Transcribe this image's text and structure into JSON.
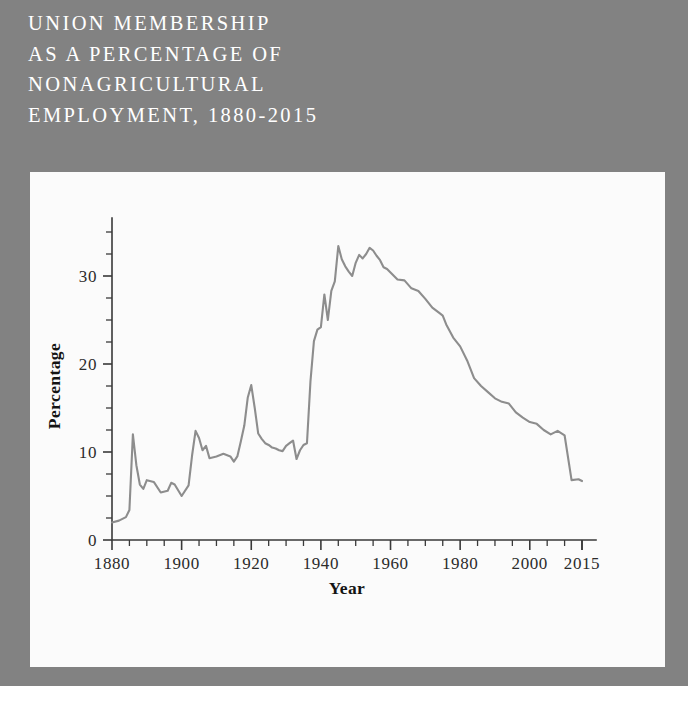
{
  "figure": {
    "title_lines": "UNION MEMBERSHIP\nAS A PERCENTAGE OF\nNONAGRICULTURAL\nEMPLOYMENT, 1880-2015",
    "backdrop_color": "#828282",
    "panel_color": "#fbfbfb",
    "title_color": "#ffffff"
  },
  "chart_data": {
    "type": "line",
    "title": "UNION MEMBERSHIP AS A PERCENTAGE OF NONAGRICULTURAL EMPLOYMENT, 1880-2015",
    "xlabel": "Year",
    "ylabel": "Percentage",
    "xlim": [
      1880,
      2015
    ],
    "ylim": [
      0,
      35
    ],
    "grid": false,
    "legend": "none",
    "line_color": "#8d8d8d",
    "x_major_ticks": [
      1880,
      1900,
      1920,
      1940,
      1960,
      1980,
      2000,
      2015
    ],
    "x_major_tick_labels": [
      "1880",
      "1900",
      "1920",
      "1940",
      "1960",
      "1980",
      "2000",
      "2015"
    ],
    "x_minor_tick_interval": 5,
    "y_major_ticks": [
      0,
      10,
      20,
      30
    ],
    "y_major_tick_labels": [
      "0",
      "10",
      "20",
      "30"
    ],
    "y_minor_tick_interval": 2.5,
    "series": [
      {
        "name": "Union membership",
        "x": [
          1880,
          1882,
          1884,
          1885,
          1886,
          1887,
          1888,
          1889,
          1890,
          1892,
          1894,
          1896,
          1897,
          1898,
          1900,
          1902,
          1903,
          1904,
          1905,
          1906,
          1907,
          1908,
          1910,
          1912,
          1914,
          1915,
          1916,
          1917,
          1918,
          1919,
          1920,
          1921,
          1922,
          1923,
          1924,
          1925,
          1926,
          1927,
          1928,
          1929,
          1930,
          1931,
          1932,
          1933,
          1934,
          1935,
          1936,
          1937,
          1938,
          1939,
          1940,
          1941,
          1942,
          1943,
          1944,
          1945,
          1946,
          1947,
          1948,
          1949,
          1950,
          1951,
          1952,
          1953,
          1954,
          1955,
          1956,
          1957,
          1958,
          1959,
          1960,
          1962,
          1964,
          1966,
          1968,
          1970,
          1972,
          1974,
          1975,
          1976,
          1978,
          1980,
          1982,
          1984,
          1986,
          1988,
          1990,
          1992,
          1994,
          1996,
          1998,
          2000,
          2002,
          2004,
          2006,
          2008,
          2010,
          2012,
          2014,
          2015
        ],
        "values": [
          2.0,
          2.2,
          2.6,
          3.4,
          12.0,
          8.5,
          6.3,
          5.8,
          6.8,
          6.6,
          5.4,
          5.6,
          6.5,
          6.3,
          5.0,
          6.2,
          9.6,
          12.4,
          11.6,
          10.2,
          10.7,
          9.3,
          9.5,
          9.8,
          9.5,
          8.9,
          9.5,
          11.2,
          13.0,
          16.2,
          17.6,
          15.0,
          12.1,
          11.5,
          11.0,
          10.8,
          10.5,
          10.4,
          10.2,
          10.1,
          10.7,
          11.0,
          11.3,
          9.2,
          10.2,
          10.8,
          11.0,
          18.0,
          22.6,
          23.9,
          24.2,
          27.9,
          25.0,
          28.3,
          29.4,
          33.4,
          31.9,
          31.1,
          30.5,
          30.0,
          31.5,
          32.4,
          32.0,
          32.5,
          33.2,
          32.9,
          32.3,
          31.8,
          31.0,
          30.8,
          30.4,
          29.6,
          29.5,
          28.6,
          28.3,
          27.4,
          26.4,
          25.8,
          25.5,
          24.5,
          23.0,
          22.0,
          20.4,
          18.4,
          17.5,
          16.8,
          16.1,
          15.7,
          15.5,
          14.5,
          13.9,
          13.4,
          13.2,
          12.5,
          12.0,
          12.4,
          11.9,
          6.8,
          6.9,
          6.7
        ]
      }
    ]
  }
}
